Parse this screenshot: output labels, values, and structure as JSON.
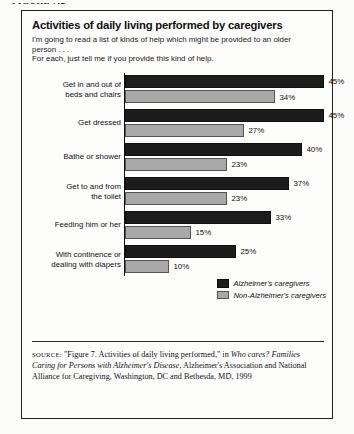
{
  "page": {
    "header": "FIGURE 7.2"
  },
  "figure": {
    "title": "Activities of daily living performed by caregivers",
    "intro_line1": "I'm going to read a list of kinds of help which might be provided to an older",
    "intro_line2": "person . . .",
    "intro_line3": "For each, just tell me if you provide this kind of help.",
    "source": {
      "label": "SOURCE:",
      "part1": " \"Figure 7. Activities of daily living performed,\" in ",
      "italic1": "Who cares? Families Caring for Persons with Alzheimer's Disease",
      "part2": ", Alzheimer's Association and National Alliance for Caregiving, Washington, DC and Bethesda, MD, 1999"
    }
  },
  "legend": {
    "items": [
      {
        "label": "Alzheimer's caregivers",
        "color": "#1c1c1c",
        "key": "alz"
      },
      {
        "label": "Non-Alzheimer's caregivers",
        "color": "#a9a9a9",
        "key": "non"
      }
    ]
  },
  "chart_data": {
    "type": "bar",
    "orientation": "horizontal",
    "title": "Activities of daily living performed by caregivers",
    "xlabel": "",
    "ylabel": "",
    "xlim": [
      0,
      50
    ],
    "grid": false,
    "legend_position": "bottom-right",
    "value_suffix": "%",
    "categories": [
      "Get in and out of beds and chairs",
      "Get dressed",
      "Bathe or shower",
      "Get to and from the toilet",
      "Feeding him or her",
      "With continence or dealing with diapers"
    ],
    "category_lines": [
      [
        "Get in and out of",
        "beds and chairs"
      ],
      [
        "Get dressed"
      ],
      [
        "Bathe or shower"
      ],
      [
        "Get to and from",
        "the toilet"
      ],
      [
        "Feeding him or her"
      ],
      [
        "With continence or",
        "dealing with diapers"
      ]
    ],
    "series": [
      {
        "name": "Alzheimer's caregivers",
        "color": "#1c1c1c",
        "values": [
          45,
          45,
          40,
          37,
          33,
          25
        ],
        "labels": [
          "45%",
          "45%",
          "40%",
          "37%",
          "33%",
          "25%"
        ]
      },
      {
        "name": "Non-Alzheimer's caregivers",
        "color": "#a9a9a9",
        "values": [
          34,
          27,
          23,
          23,
          15,
          10
        ],
        "labels": [
          "34%",
          "27%",
          "23%",
          "23%",
          "15%",
          "10%"
        ]
      }
    ]
  }
}
